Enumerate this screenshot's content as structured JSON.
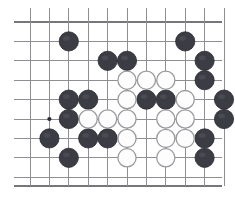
{
  "board": {
    "title": "Go board position",
    "type": "go-board-diagram",
    "visible_columns": 11,
    "visible_rows": 9,
    "cell_size": 19.4,
    "origin_x": 30,
    "origin_y": 22,
    "grid_color": "#8e8e93",
    "edge_color": "#76767b",
    "background_color": "#ffffff",
    "black_stone_color": "#3c3c44",
    "white_stone_color": "#fdfdfd",
    "white_stone_outline": "#9a9a9f",
    "stone_radius": 9.6,
    "left_edge_x": 14,
    "right_edge_x": 222,
    "top_edge_y": 22,
    "bottom_edge_y": 186,
    "hoshi_points": [
      {
        "col": 1,
        "row": 5
      }
    ],
    "black_stones": [
      {
        "col": 2,
        "row": 1
      },
      {
        "col": 8,
        "row": 1
      },
      {
        "col": 4,
        "row": 2
      },
      {
        "col": 5,
        "row": 2
      },
      {
        "col": 9,
        "row": 2
      },
      {
        "col": 9,
        "row": 3
      },
      {
        "col": 2,
        "row": 4
      },
      {
        "col": 3,
        "row": 4
      },
      {
        "col": 6,
        "row": 4
      },
      {
        "col": 7,
        "row": 4
      },
      {
        "col": 10,
        "row": 4
      },
      {
        "col": 2,
        "row": 5
      },
      {
        "col": 10,
        "row": 5
      },
      {
        "col": 1,
        "row": 6
      },
      {
        "col": 3,
        "row": 6
      },
      {
        "col": 4,
        "row": 6
      },
      {
        "col": 9,
        "row": 6
      },
      {
        "col": 2,
        "row": 7
      },
      {
        "col": 9,
        "row": 7
      }
    ],
    "white_stones": [
      {
        "col": 5,
        "row": 3
      },
      {
        "col": 6,
        "row": 3
      },
      {
        "col": 7,
        "row": 3
      },
      {
        "col": 5,
        "row": 4
      },
      {
        "col": 8,
        "row": 4
      },
      {
        "col": 3,
        "row": 5
      },
      {
        "col": 4,
        "row": 5
      },
      {
        "col": 5,
        "row": 5
      },
      {
        "col": 7,
        "row": 5
      },
      {
        "col": 8,
        "row": 5
      },
      {
        "col": 5,
        "row": 6
      },
      {
        "col": 7,
        "row": 6
      },
      {
        "col": 8,
        "row": 6
      },
      {
        "col": 5,
        "row": 7
      },
      {
        "col": 7,
        "row": 7
      }
    ]
  }
}
